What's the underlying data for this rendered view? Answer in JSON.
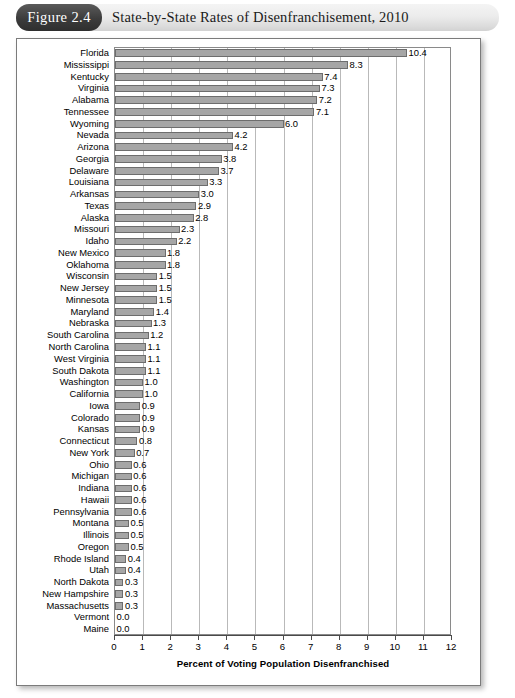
{
  "header": {
    "badge_label": "Figure 2.4",
    "title": "State-by-State Rates of Disenfranchisement, 2010",
    "badge_color": "#3c3c3c",
    "band_color": "#e8e8e8"
  },
  "chart_data": {
    "type": "bar",
    "orientation": "horizontal",
    "title": "State-by-State Rates of Disenfranchisement, 2010",
    "xlabel": "Percent of Voting Population Disenfranchised",
    "ylabel": "",
    "xlim": [
      0,
      12
    ],
    "xticks": [
      0,
      1,
      2,
      3,
      4,
      5,
      6,
      7,
      8,
      9,
      10,
      11,
      12
    ],
    "xtick_labels": [
      "0",
      "1",
      "2",
      "3",
      "4",
      "5",
      "6",
      "7",
      "8",
      "9",
      "10",
      "11",
      "12"
    ],
    "grid": true,
    "grid_axis": "x",
    "legend": false,
    "bar_color": "#a6a6a6",
    "bar_edge_color": "#6d6d6d",
    "value_label_format": "0.0",
    "categories": [
      "Florida",
      "Mississippi",
      "Kentucky",
      "Virginia",
      "Alabama",
      "Tennessee",
      "Wyoming",
      "Nevada",
      "Arizona",
      "Georgia",
      "Delaware",
      "Louisiana",
      "Arkansas",
      "Texas",
      "Alaska",
      "Missouri",
      "Idaho",
      "New Mexico",
      "Oklahoma",
      "Wisconsin",
      "New Jersey",
      "Minnesota",
      "Maryland",
      "Nebraska",
      "South Carolina",
      "North Carolina",
      "West Virginia",
      "South Dakota",
      "Washington",
      "California",
      "Iowa",
      "Colorado",
      "Kansas",
      "Connecticut",
      "New York",
      "Ohio",
      "Michigan",
      "Indiana",
      "Hawaii",
      "Pennsylvania",
      "Montana",
      "Illinois",
      "Oregon",
      "Rhode Island",
      "Utah",
      "North Dakota",
      "New Hampshire",
      "Massachusetts",
      "Vermont",
      "Maine"
    ],
    "values": [
      10.4,
      8.3,
      7.4,
      7.3,
      7.2,
      7.1,
      6.0,
      4.2,
      4.2,
      3.8,
      3.7,
      3.3,
      3.0,
      2.9,
      2.8,
      2.3,
      2.2,
      1.8,
      1.8,
      1.5,
      1.5,
      1.5,
      1.4,
      1.3,
      1.2,
      1.1,
      1.1,
      1.1,
      1.0,
      1.0,
      0.9,
      0.9,
      0.9,
      0.8,
      0.7,
      0.6,
      0.6,
      0.6,
      0.6,
      0.6,
      0.5,
      0.5,
      0.5,
      0.4,
      0.4,
      0.3,
      0.3,
      0.3,
      0.0,
      0.0
    ],
    "value_labels": [
      "10.4",
      "8.3",
      "7.4",
      "7.3",
      "7.2",
      "7.1",
      "6.0",
      "4.2",
      "4.2",
      "3.8",
      "3.7",
      "3.3",
      "3.0",
      "2.9",
      "2.8",
      "2.3",
      "2.2",
      "1.8",
      "1.8",
      "1.5",
      "1.5",
      "1.5",
      "1.4",
      "1.3",
      "1.2",
      "1.1",
      "1.1",
      "1.1",
      "1.0",
      "1.0",
      "0.9",
      "0.9",
      "0.9",
      "0.8",
      "0.7",
      "0.6",
      "0.6",
      "0.6",
      "0.6",
      "0.6",
      "0.5",
      "0.5",
      "0.5",
      "0.4",
      "0.4",
      "0.3",
      "0.3",
      "0.3",
      "0.0",
      "0.0"
    ]
  }
}
